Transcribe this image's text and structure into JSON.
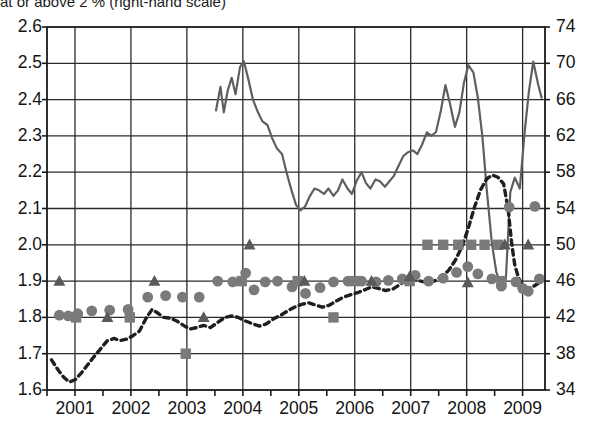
{
  "caption": {
    "text": "at or above 2 % (right-hand scale)"
  },
  "colors": {
    "line_solid": "#5f5f5f",
    "line_dashed": "#1f1f1f",
    "marker": "#7a7a7a",
    "axis": "#1a1a1a",
    "grid": "#2b2b2b",
    "background": "#ffffff"
  },
  "chart_data": {
    "type": "line",
    "title": "at or above 2 % (right-hand scale)",
    "xlabel": "",
    "ylabel": "",
    "grid": true,
    "legend_position": "none",
    "x_axis": {
      "tick_labels": [
        "2001",
        "2002",
        "2003",
        "2004",
        "2005",
        "2006",
        "2007",
        "2008",
        "2009"
      ],
      "tick_values": [
        2001,
        2002,
        2003,
        2004,
        2005,
        2006,
        2007,
        2008,
        2009
      ],
      "range": [
        2000.5,
        2009.4
      ]
    },
    "y_axis_left": {
      "tick_labels": [
        "1.6",
        "1.7",
        "1.8",
        "1.9",
        "2.0",
        "2.1",
        "2.2",
        "2.3",
        "2.4",
        "2.5",
        "2.6"
      ],
      "tick_values": [
        1.6,
        1.7,
        1.8,
        1.9,
        2.0,
        2.1,
        2.2,
        2.3,
        2.4,
        2.5,
        2.6
      ],
      "range": [
        1.6,
        2.6
      ],
      "scale": "left-hand scale"
    },
    "y_axis_right": {
      "tick_labels": [
        "34",
        "38",
        "42",
        "46",
        "50",
        "54",
        "58",
        "62",
        "66",
        "70",
        "74"
      ],
      "tick_values": [
        34,
        38,
        42,
        46,
        50,
        54,
        58,
        62,
        66,
        70,
        74
      ],
      "range": [
        34,
        74
      ],
      "scale": "right-hand scale"
    },
    "series": [
      {
        "name": "share at or above 2 % (right-hand scale)",
        "type": "line",
        "style": "solid",
        "color": "#5f5f5f",
        "axis": "right",
        "points": [
          [
            2003.52,
            64.8
          ],
          [
            2003.6,
            67.4
          ],
          [
            2003.66,
            64.6
          ],
          [
            2003.73,
            67.0
          ],
          [
            2003.8,
            68.4
          ],
          [
            2003.87,
            66.6
          ],
          [
            2003.95,
            69.6
          ],
          [
            2004.02,
            70.2
          ],
          [
            2004.1,
            68.2
          ],
          [
            2004.18,
            66.0
          ],
          [
            2004.27,
            64.6
          ],
          [
            2004.35,
            63.6
          ],
          [
            2004.44,
            63.2
          ],
          [
            2004.52,
            61.8
          ],
          [
            2004.61,
            60.6
          ],
          [
            2004.7,
            60.0
          ],
          [
            2004.78,
            58.0
          ],
          [
            2004.87,
            56.0
          ],
          [
            2004.95,
            54.4
          ],
          [
            2005.03,
            53.8
          ],
          [
            2005.11,
            54.2
          ],
          [
            2005.2,
            55.4
          ],
          [
            2005.28,
            56.2
          ],
          [
            2005.36,
            56.0
          ],
          [
            2005.45,
            55.6
          ],
          [
            2005.53,
            56.2
          ],
          [
            2005.62,
            55.4
          ],
          [
            2005.7,
            56.0
          ],
          [
            2005.78,
            57.2
          ],
          [
            2005.87,
            56.2
          ],
          [
            2005.95,
            55.6
          ],
          [
            2006.03,
            57.0
          ],
          [
            2006.12,
            58.0
          ],
          [
            2006.2,
            56.8
          ],
          [
            2006.28,
            56.2
          ],
          [
            2006.37,
            57.2
          ],
          [
            2006.45,
            57.0
          ],
          [
            2006.54,
            56.4
          ],
          [
            2006.62,
            57.0
          ],
          [
            2006.7,
            57.6
          ],
          [
            2006.79,
            58.8
          ],
          [
            2006.87,
            59.8
          ],
          [
            2006.95,
            60.2
          ],
          [
            2007.04,
            60.4
          ],
          [
            2007.12,
            60.0
          ],
          [
            2007.2,
            61.0
          ],
          [
            2007.29,
            62.4
          ],
          [
            2007.37,
            62.0
          ],
          [
            2007.45,
            62.4
          ],
          [
            2007.54,
            64.8
          ],
          [
            2007.62,
            67.6
          ],
          [
            2007.7,
            65.6
          ],
          [
            2007.79,
            63.0
          ],
          [
            2007.87,
            64.6
          ],
          [
            2007.95,
            67.8
          ],
          [
            2008.03,
            69.8
          ],
          [
            2008.12,
            69.0
          ],
          [
            2008.2,
            66.2
          ],
          [
            2008.28,
            62.0
          ],
          [
            2008.36,
            56.0
          ],
          [
            2008.45,
            50.2
          ],
          [
            2008.53,
            47.0
          ],
          [
            2008.61,
            45.6
          ],
          [
            2008.7,
            46.2
          ],
          [
            2008.78,
            55.8
          ],
          [
            2008.86,
            57.4
          ],
          [
            2008.95,
            56.2
          ],
          [
            2009.03,
            62.0
          ],
          [
            2009.11,
            66.8
          ],
          [
            2009.19,
            70.2
          ],
          [
            2009.28,
            67.6
          ],
          [
            2009.34,
            66.2
          ]
        ]
      },
      {
        "name": "dashed indicator (left-hand scale)",
        "type": "line",
        "style": "dashed",
        "color": "#1f1f1f",
        "axis": "left",
        "points": [
          [
            2000.58,
            1.683
          ],
          [
            2000.7,
            1.655
          ],
          [
            2000.8,
            1.635
          ],
          [
            2000.9,
            1.622
          ],
          [
            2001.0,
            1.628
          ],
          [
            2001.12,
            1.648
          ],
          [
            2001.22,
            1.668
          ],
          [
            2001.33,
            1.69
          ],
          [
            2001.45,
            1.712
          ],
          [
            2001.58,
            1.736
          ],
          [
            2001.7,
            1.742
          ],
          [
            2001.8,
            1.736
          ],
          [
            2001.92,
            1.74
          ],
          [
            2002.02,
            1.748
          ],
          [
            2002.15,
            1.762
          ],
          [
            2002.28,
            1.8
          ],
          [
            2002.38,
            1.822
          ],
          [
            2002.48,
            1.812
          ],
          [
            2002.58,
            1.8
          ],
          [
            2002.7,
            1.798
          ],
          [
            2002.82,
            1.79
          ],
          [
            2002.94,
            1.778
          ],
          [
            2003.05,
            1.768
          ],
          [
            2003.18,
            1.772
          ],
          [
            2003.3,
            1.778
          ],
          [
            2003.42,
            1.772
          ],
          [
            2003.55,
            1.786
          ],
          [
            2003.68,
            1.8
          ],
          [
            2003.8,
            1.804
          ],
          [
            2003.92,
            1.8
          ],
          [
            2004.05,
            1.79
          ],
          [
            2004.18,
            1.782
          ],
          [
            2004.3,
            1.776
          ],
          [
            2004.42,
            1.782
          ],
          [
            2004.55,
            1.796
          ],
          [
            2004.68,
            1.806
          ],
          [
            2004.8,
            1.818
          ],
          [
            2004.92,
            1.828
          ],
          [
            2005.05,
            1.836
          ],
          [
            2005.18,
            1.84
          ],
          [
            2005.3,
            1.834
          ],
          [
            2005.42,
            1.828
          ],
          [
            2005.55,
            1.834
          ],
          [
            2005.68,
            1.846
          ],
          [
            2005.8,
            1.856
          ],
          [
            2005.92,
            1.862
          ],
          [
            2006.05,
            1.868
          ],
          [
            2006.18,
            1.876
          ],
          [
            2006.3,
            1.884
          ],
          [
            2006.42,
            1.88
          ],
          [
            2006.55,
            1.874
          ],
          [
            2006.68,
            1.878
          ],
          [
            2006.8,
            1.89
          ],
          [
            2006.92,
            1.902
          ],
          [
            2007.05,
            1.906
          ],
          [
            2007.18,
            1.9
          ],
          [
            2007.3,
            1.896
          ],
          [
            2007.42,
            1.9
          ],
          [
            2007.55,
            1.912
          ],
          [
            2007.68,
            1.93
          ],
          [
            2007.8,
            1.958
          ],
          [
            2007.92,
            1.996
          ],
          [
            2008.03,
            2.046
          ],
          [
            2008.14,
            2.104
          ],
          [
            2008.25,
            2.152
          ],
          [
            2008.36,
            2.182
          ],
          [
            2008.46,
            2.192
          ],
          [
            2008.56,
            2.186
          ],
          [
            2008.66,
            2.168
          ],
          [
            2008.74,
            2.1
          ],
          [
            2008.8,
            2.01
          ],
          [
            2008.86,
            1.944
          ],
          [
            2008.93,
            1.908
          ],
          [
            2009.0,
            1.888
          ],
          [
            2009.1,
            1.88
          ],
          [
            2009.2,
            1.886
          ],
          [
            2009.3,
            1.896
          ]
        ]
      },
      {
        "name": "circle markers (left-hand scale)",
        "type": "scatter",
        "marker": "circle",
        "color": "#7a7a7a",
        "axis": "left",
        "points": [
          [
            2000.72,
            1.806
          ],
          [
            2000.88,
            1.804
          ],
          [
            2001.05,
            1.81
          ],
          [
            2001.3,
            1.818
          ],
          [
            2001.62,
            1.82
          ],
          [
            2001.95,
            1.822
          ],
          [
            2002.3,
            1.856
          ],
          [
            2002.62,
            1.86
          ],
          [
            2002.92,
            1.856
          ],
          [
            2003.22,
            1.856
          ],
          [
            2003.55,
            1.9
          ],
          [
            2003.82,
            1.898
          ],
          [
            2004.05,
            1.922
          ],
          [
            2004.2,
            1.876
          ],
          [
            2004.4,
            1.898
          ],
          [
            2004.62,
            1.9
          ],
          [
            2004.88,
            1.884
          ],
          [
            2005.12,
            1.866
          ],
          [
            2005.38,
            1.882
          ],
          [
            2005.62,
            1.898
          ],
          [
            2005.88,
            1.9
          ],
          [
            2006.12,
            1.9
          ],
          [
            2006.38,
            1.898
          ],
          [
            2006.6,
            1.902
          ],
          [
            2006.85,
            1.906
          ],
          [
            2007.08,
            1.916
          ],
          [
            2007.32,
            1.9
          ],
          [
            2007.58,
            1.908
          ],
          [
            2007.82,
            1.924
          ],
          [
            2008.02,
            1.94
          ],
          [
            2008.2,
            1.92
          ],
          [
            2008.45,
            1.906
          ],
          [
            2008.62,
            1.886
          ],
          [
            2008.76,
            2.104
          ],
          [
            2008.88,
            1.898
          ],
          [
            2009.0,
            1.88
          ],
          [
            2009.1,
            1.872
          ],
          [
            2009.22,
            2.106
          ],
          [
            2009.3,
            1.906
          ]
        ]
      },
      {
        "name": "square markers (left-hand scale)",
        "type": "scatter",
        "marker": "square",
        "color": "#7a7a7a",
        "axis": "left",
        "points": [
          [
            2001.02,
            1.8
          ],
          [
            2001.98,
            1.8
          ],
          [
            2002.98,
            1.7
          ],
          [
            2003.98,
            1.9
          ],
          [
            2004.98,
            1.9
          ],
          [
            2005.62,
            1.8
          ],
          [
            2006.0,
            1.9
          ],
          [
            2006.98,
            1.9
          ],
          [
            2007.3,
            2.0
          ],
          [
            2007.58,
            2.0
          ],
          [
            2007.85,
            2.0
          ],
          [
            2008.08,
            2.0
          ],
          [
            2008.32,
            2.0
          ],
          [
            2008.56,
            2.0
          ],
          [
            2008.62,
            1.9
          ]
        ]
      },
      {
        "name": "triangle markers (left-hand scale)",
        "type": "scatter",
        "marker": "triangle",
        "color": "#5a5a5a",
        "axis": "left",
        "points": [
          [
            2000.72,
            1.9
          ],
          [
            2001.58,
            1.8
          ],
          [
            2002.42,
            1.9
          ],
          [
            2003.3,
            1.8
          ],
          [
            2004.12,
            2.0
          ],
          [
            2005.1,
            1.9
          ],
          [
            2006.3,
            1.9
          ],
          [
            2006.98,
            1.912
          ],
          [
            2008.02,
            1.896
          ],
          [
            2008.68,
            2.0
          ],
          [
            2009.1,
            2.0
          ]
        ]
      }
    ]
  }
}
